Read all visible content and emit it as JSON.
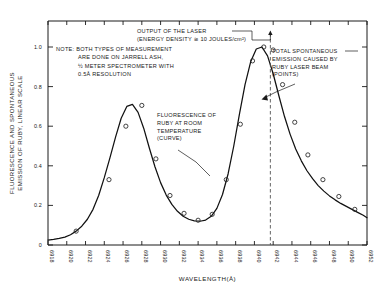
{
  "chart_data": {
    "type": "line",
    "title": "",
    "xlabel": "WAVELENGTH(Å)",
    "ylabel": "FLUORESCENCE AND SPONTANEOUS EMISSION OF RUBY, LINEAR SCALE",
    "xlim": [
      6918,
      6952
    ],
    "ylim": [
      0,
      1.05
    ],
    "grid": false,
    "legend_position": "none",
    "xticks": [
      "6918",
      "6920",
      "6922",
      "6924",
      "6926",
      "6928",
      "6930",
      "6932",
      "6934",
      "6936",
      "6938",
      "6940",
      "6942",
      "6944",
      "6946",
      "6948",
      "6950",
      "6952"
    ],
    "yticks": [
      "0",
      "0.2",
      "0.4",
      "0.6",
      "0.8",
      "1.0"
    ],
    "ytick_values": [
      0,
      0.2,
      0.4,
      0.6,
      0.8,
      1.0
    ],
    "series": [
      {
        "name": "Fluorescence of ruby at room temperature",
        "style": "curve",
        "x": [
          6918.0,
          6918.6,
          6919.2,
          6919.8,
          6920.4,
          6921.0,
          6921.6,
          6922.2,
          6922.8,
          6923.4,
          6924.0,
          6924.6,
          6925.2,
          6925.8,
          6926.4,
          6927.0,
          6927.6,
          6928.2,
          6928.8,
          6929.4,
          6930.0,
          6930.6,
          6931.2,
          6931.8,
          6932.4,
          6933.0,
          6933.6,
          6934.2,
          6934.8,
          6935.4,
          6936.0,
          6936.6,
          6937.2,
          6937.8,
          6938.4,
          6939.0,
          6939.6,
          6940.2,
          6940.8,
          6941.4,
          6942.0,
          6942.6,
          6943.2,
          6943.8,
          6944.4,
          6945.0,
          6945.6,
          6946.2,
          6946.8,
          6947.4,
          6948.0,
          6948.6,
          6949.2,
          6949.8,
          6950.4,
          6951.0,
          6951.6,
          6952.0
        ],
        "y": [
          0.025,
          0.028,
          0.033,
          0.04,
          0.052,
          0.07,
          0.095,
          0.13,
          0.18,
          0.25,
          0.34,
          0.44,
          0.545,
          0.64,
          0.7,
          0.71,
          0.67,
          0.59,
          0.49,
          0.395,
          0.315,
          0.252,
          0.205,
          0.17,
          0.145,
          0.13,
          0.122,
          0.12,
          0.126,
          0.145,
          0.185,
          0.255,
          0.36,
          0.5,
          0.66,
          0.81,
          0.925,
          0.99,
          1.0,
          0.955,
          0.865,
          0.755,
          0.65,
          0.56,
          0.485,
          0.425,
          0.375,
          0.335,
          0.3,
          0.272,
          0.248,
          0.228,
          0.21,
          0.195,
          0.18,
          0.165,
          0.15,
          0.138
        ]
      },
      {
        "name": "Total spontaneous emission caused by ruby laser beam",
        "style": "points",
        "x": [
          6921.0,
          6924.5,
          6926.3,
          6928.0,
          6929.5,
          6931.0,
          6932.5,
          6934.0,
          6935.5,
          6937.0,
          6938.5,
          6939.8,
          6941.0,
          6942.0,
          6943.0,
          6944.3,
          6945.7,
          6947.3,
          6949.0,
          6950.7
        ],
        "y": [
          0.07,
          0.33,
          0.6,
          0.705,
          0.435,
          0.25,
          0.16,
          0.125,
          0.155,
          0.33,
          0.61,
          0.93,
          1.0,
          0.985,
          0.81,
          0.62,
          0.455,
          0.33,
          0.245,
          0.18
        ]
      }
    ],
    "annotations": [
      {
        "id": "laser-output",
        "lines": [
          "OUTPUT OF THE LASER",
          "(ENERGY DENSITY ≅ 10 JOULES/cm²)"
        ],
        "marker_wavelength": 6941.7
      },
      {
        "id": "note",
        "lines": [
          "NOTE: BOTH TYPES OF MEASUREMENT",
          "ARE DONE ON JARRELL ASH,",
          "½ METER SPECTROMETER WITH",
          "0.5Å RESOLUTION"
        ],
        "label": "NOTE:"
      },
      {
        "id": "fluorescence-curve",
        "lines": [
          "FLUORESCENCE OF",
          "RUBY AT ROOM",
          "TEMPERATURE",
          "(CURVE)"
        ]
      },
      {
        "id": "spontaneous-emission-points",
        "lines": [
          "TOTAL SPONTANEOUS",
          "EMISSION CAUSED BY",
          "RUBY LASER BEAM",
          "(POINTS)"
        ]
      }
    ],
    "colors": {
      "axis": "#1a1a1a",
      "curve": "#111111",
      "points": "#222222",
      "dashed_line": "#555555",
      "background": "#ffffff"
    }
  }
}
